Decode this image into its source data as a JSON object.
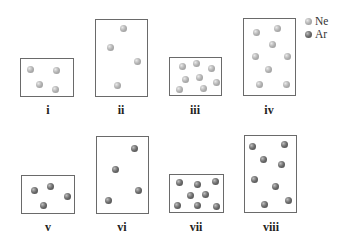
{
  "legend": [
    {
      "label": "Ne",
      "kind": "ne",
      "color": "#b5b5b5"
    },
    {
      "label": "Ar",
      "kind": "ar",
      "color": "#5a5a5a"
    }
  ],
  "panels": [
    {
      "label": "i",
      "gas": "Ne",
      "box": {
        "x": 20,
        "y": 58,
        "w": 54,
        "h": 39
      },
      "particles": [
        [
          30,
          69
        ],
        [
          56,
          70
        ],
        [
          39,
          84
        ],
        [
          55,
          89
        ]
      ]
    },
    {
      "label": "ii",
      "gas": "Ne",
      "box": {
        "x": 95,
        "y": 19,
        "w": 53,
        "h": 78
      },
      "particles": [
        [
          123,
          28
        ],
        [
          110,
          47
        ],
        [
          137,
          61
        ],
        [
          117,
          85
        ]
      ]
    },
    {
      "label": "iii",
      "gas": "Ne",
      "box": {
        "x": 169,
        "y": 57,
        "w": 53,
        "h": 39
      },
      "particles": [
        [
          182,
          66
        ],
        [
          196,
          63
        ],
        [
          211,
          68
        ],
        [
          185,
          79
        ],
        [
          199,
          77
        ],
        [
          216,
          82
        ],
        [
          179,
          89
        ],
        [
          203,
          88
        ]
      ]
    },
    {
      "label": "iv",
      "gas": "Ne",
      "box": {
        "x": 243,
        "y": 18,
        "w": 53,
        "h": 78
      },
      "particles": [
        [
          256,
          32
        ],
        [
          277,
          28
        ],
        [
          272,
          44
        ],
        [
          255,
          56
        ],
        [
          287,
          56
        ],
        [
          268,
          69
        ],
        [
          259,
          84
        ],
        [
          286,
          84
        ]
      ]
    },
    {
      "label": "v",
      "gas": "Ar",
      "box": {
        "x": 21,
        "y": 175,
        "w": 54,
        "h": 39
      },
      "particles": [
        [
          34,
          190
        ],
        [
          50,
          186
        ],
        [
          67,
          196
        ],
        [
          43,
          205
        ]
      ]
    },
    {
      "label": "vi",
      "gas": "Ar",
      "box": {
        "x": 96,
        "y": 136,
        "w": 53,
        "h": 78
      },
      "particles": [
        [
          134,
          148
        ],
        [
          115,
          169
        ],
        [
          138,
          190
        ],
        [
          108,
          200
        ]
      ]
    },
    {
      "label": "vii",
      "gas": "Ar",
      "box": {
        "x": 169,
        "y": 174,
        "w": 55,
        "h": 39
      },
      "particles": [
        [
          179,
          182
        ],
        [
          197,
          184
        ],
        [
          215,
          181
        ],
        [
          190,
          195
        ],
        [
          205,
          194
        ],
        [
          177,
          205
        ],
        [
          197,
          205
        ],
        [
          216,
          206
        ]
      ]
    },
    {
      "label": "viii",
      "gas": "Ar",
      "box": {
        "x": 244,
        "y": 135,
        "w": 53,
        "h": 78
      },
      "particles": [
        [
          252,
          146
        ],
        [
          284,
          144
        ],
        [
          263,
          159
        ],
        [
          281,
          164
        ],
        [
          254,
          179
        ],
        [
          275,
          186
        ],
        [
          264,
          204
        ],
        [
          288,
          200
        ]
      ]
    }
  ],
  "label_positions": [
    [
      48,
      104
    ],
    [
      121,
      104
    ],
    [
      195,
      104
    ],
    [
      269,
      104
    ],
    [
      48,
      221
    ],
    [
      122,
      221
    ],
    [
      196,
      221
    ],
    [
      271,
      221
    ]
  ]
}
